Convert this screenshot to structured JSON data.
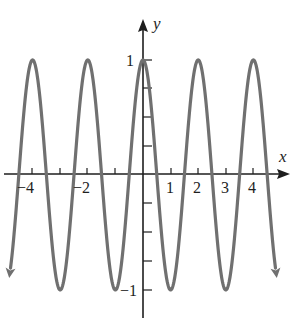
{
  "chart_data": {
    "type": "line",
    "title": "",
    "function": "y = cos(pi x)",
    "xlabel": "x",
    "ylabel": "y",
    "xlim": [
      -4.85,
      4.85
    ],
    "ylim": [
      -1,
      1
    ],
    "x_tick_labels": [
      "-4",
      "-2",
      "1",
      "2",
      "3",
      "4"
    ],
    "x_ticks": [
      -4,
      -3,
      -2,
      -1,
      1,
      2,
      3,
      4
    ],
    "y_tick_labels": [
      "1",
      "-1"
    ],
    "y_ticks": [
      -1,
      -0.75,
      -0.5,
      -0.25,
      0.25,
      0.5,
      0.75,
      1
    ],
    "grid": false,
    "legend": null,
    "series": [
      {
        "name": "cos(pi x)",
        "color": "#707070",
        "x": [
          -4.8,
          -4,
          -3.5,
          -3,
          -2.5,
          -2,
          -1.5,
          -1,
          -0.5,
          0,
          0.5,
          1,
          1.5,
          2,
          2.5,
          3,
          3.5,
          4,
          4.8
        ],
        "values": [
          -0.81,
          1,
          0,
          -1,
          0,
          1,
          0,
          -1,
          0,
          1,
          0,
          -1,
          0,
          1,
          0,
          -1,
          0,
          1,
          -0.81
        ]
      }
    ],
    "annotations": [
      "arrowheads at both curve ends",
      "arrowheads on positive x and y axes"
    ]
  },
  "labels": {
    "x_axis": "x",
    "y_axis": "y",
    "xt_neg4": "−4",
    "xt_neg2": "−2",
    "xt_1": "1",
    "xt_2": "2",
    "xt_3": "3",
    "xt_4": "4",
    "yt_1": "1",
    "yt_neg1": "−1"
  },
  "colors": {
    "curve": "#707070",
    "axes": "#1e1e1e"
  }
}
